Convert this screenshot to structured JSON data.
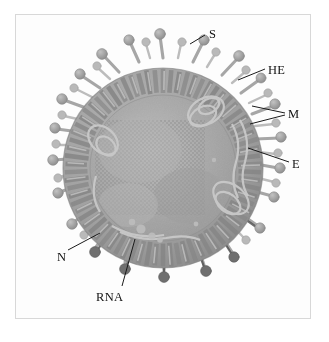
{
  "figure": {
    "background_color": "#ffffff",
    "frame_color": "#d8d8d8",
    "label_color": "#111111",
    "particle": {
      "envelope_color": "#9a9a9a",
      "core_color": "#a8a8a8",
      "spike_color": "#b0b0b0",
      "spike_head_color": "#9d9d9d",
      "stalk_dark_color": "#4a4a4a"
    }
  },
  "labels": [
    {
      "id": "S",
      "text": "S",
      "x": 209,
      "y": 28,
      "leader": [
        [
          205,
          35
        ],
        [
          190,
          44
        ]
      ]
    },
    {
      "id": "HE",
      "text": "HE",
      "x": 268,
      "y": 64,
      "leader": [
        [
          265,
          69
        ],
        [
          238,
          80
        ]
      ]
    },
    {
      "id": "M",
      "text": "M",
      "x": 288,
      "y": 108,
      "leader": [
        [
          285,
          113
        ],
        [
          252,
          106
        ]
      ]
    },
    {
      "id": "M2",
      "text": "",
      "x": 288,
      "y": 108,
      "leader": [
        [
          285,
          115
        ],
        [
          250,
          124
        ]
      ]
    },
    {
      "id": "E",
      "text": "E",
      "x": 292,
      "y": 158,
      "leader": [
        [
          289,
          162
        ],
        [
          248,
          148
        ]
      ]
    },
    {
      "id": "N",
      "text": "N",
      "x": 57,
      "y": 251,
      "leader": [
        [
          68,
          250
        ],
        [
          100,
          233
        ]
      ]
    },
    {
      "id": "RNA",
      "text": "RNA",
      "x": 96,
      "y": 291,
      "leader": [
        [
          122,
          286
        ],
        [
          135,
          239
        ]
      ]
    }
  ],
  "annotation_list": {
    "S": "spike glycoprotein",
    "HE": "hemagglutinin-esterase",
    "M": "membrane protein",
    "E": "envelope protein",
    "N": "nucleocapsid protein",
    "RNA": "viral genomic RNA"
  }
}
